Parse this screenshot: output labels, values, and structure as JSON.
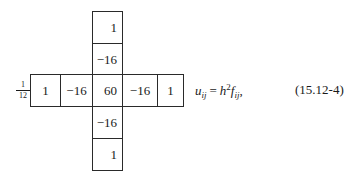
{
  "stencil": {
    "multiplier": {
      "numerator": "1",
      "denominator": "12"
    },
    "column_cells": {
      "top_outer": "1",
      "top_inner": "−16",
      "bottom_inner": "−16",
      "bottom_outer": "1"
    },
    "row_cells": {
      "left_outer": "1",
      "left_inner": "−16",
      "center": "60",
      "right_inner": "−16",
      "right_outer": "1"
    }
  },
  "equation": {
    "lhs_var": "u",
    "lhs_sub": "ij",
    "operator": "=",
    "rhs_var1": "h",
    "rhs_sup": "2",
    "rhs_var2": "f",
    "rhs_sub": "ij",
    "trailing": ",",
    "number": "(15.12-4)"
  }
}
